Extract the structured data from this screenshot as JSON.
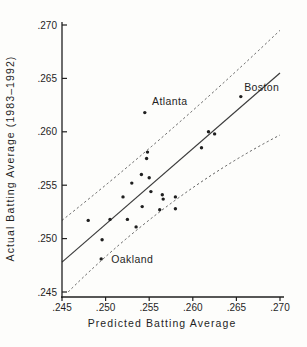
{
  "figure": {
    "background": "#fdfdfb",
    "ink_color": "#1f1f1f",
    "line_color": "#3c3c3c",
    "band_color": "#4a4a4a"
  },
  "chart_data": {
    "type": "scatter",
    "title": "",
    "xlabel": "Predicted Batting Average",
    "ylabel": "Actual Batting Average (1983–1992)",
    "xlim": [
      0.245,
      0.27
    ],
    "ylim": [
      0.245,
      0.27
    ],
    "x_tick_values": [
      0.245,
      0.25,
      0.255,
      0.26,
      0.265,
      0.27
    ],
    "x_tick_labels": [
      ".245",
      ".250",
      ".255",
      ".260",
      ".265",
      ".270"
    ],
    "y_tick_values": [
      0.245,
      0.25,
      0.255,
      0.26,
      0.265,
      0.27
    ],
    "y_tick_labels": [
      ".245",
      ".250",
      ".255",
      ".260",
      ".265",
      ".270"
    ],
    "grid": false,
    "legend": null,
    "points": [
      [
        0.248,
        0.2517
      ],
      [
        0.2495,
        0.2481
      ],
      [
        0.2496,
        0.2499
      ],
      [
        0.2505,
        0.2518
      ],
      [
        0.252,
        0.2539
      ],
      [
        0.2525,
        0.2518
      ],
      [
        0.2535,
        0.2511
      ],
      [
        0.253,
        0.2552
      ],
      [
        0.2541,
        0.256
      ],
      [
        0.255,
        0.2557
      ],
      [
        0.2545,
        0.2618
      ],
      [
        0.2548,
        0.2581
      ],
      [
        0.2547,
        0.2575
      ],
      [
        0.2542,
        0.253
      ],
      [
        0.2552,
        0.2544
      ],
      [
        0.2565,
        0.2541
      ],
      [
        0.2566,
        0.2537
      ],
      [
        0.258,
        0.2539
      ],
      [
        0.2562,
        0.2527
      ],
      [
        0.258,
        0.2528
      ],
      [
        0.261,
        0.2585
      ],
      [
        0.2618,
        0.26
      ],
      [
        0.2625,
        0.2598
      ],
      [
        0.2655,
        0.2633
      ]
    ],
    "regression_line": {
      "style": "solid",
      "x1": 0.245,
      "y1": 0.2478,
      "x2": 0.27,
      "y2": 0.2655
    },
    "confidence_bands": {
      "style": "dashed",
      "upper": [
        [
          0.245,
          0.2517
        ],
        [
          0.2575,
          0.2602
        ],
        [
          0.27,
          0.2695
        ]
      ],
      "lower": [
        [
          0.2457,
          0.245
        ],
        [
          0.2575,
          0.2533
        ],
        [
          0.27,
          0.2597
        ]
      ]
    },
    "annotations": [
      {
        "label": "Atlanta",
        "x": 0.2545,
        "y": 0.2618,
        "dx": 25,
        "dy": -11
      },
      {
        "label": "Boston",
        "x": 0.2655,
        "y": 0.2633,
        "dx": 21,
        "dy": -9
      },
      {
        "label": "Oakland",
        "x": 0.2495,
        "y": 0.2481,
        "dx": 31,
        "dy": 1
      }
    ]
  }
}
